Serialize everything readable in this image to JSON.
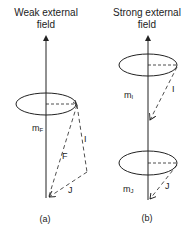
{
  "panels": [
    {
      "id": "a",
      "title_line1": "Weak external",
      "title_line2": "field",
      "caption": "(a)",
      "labels": {
        "projection": "mF",
        "projection_main": "m",
        "projection_sub": "F",
        "vec_I": "I",
        "vec_F": "F",
        "vec_J": "J"
      }
    },
    {
      "id": "b",
      "title_line1": "Strong external",
      "title_line2": "field",
      "caption": "(b)",
      "labels": {
        "projection_I_main": "m",
        "projection_I_sub": "I",
        "vec_I": "I",
        "projection_J_main": "m",
        "projection_J_sub": "J",
        "vec_J": "J"
      }
    }
  ],
  "colors": {
    "ink": "#222222",
    "background": "#ffffff"
  }
}
